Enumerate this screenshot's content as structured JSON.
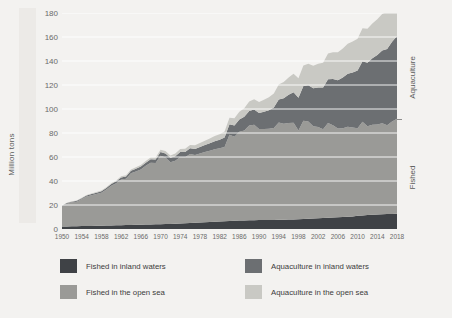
{
  "chart_data": {
    "type": "area",
    "stacked": true,
    "title": "",
    "xlabel": "",
    "ylabel": "Million tons",
    "ylim": [
      0,
      180
    ],
    "xlim": [
      1950,
      2018
    ],
    "grid": true,
    "legend_position": "bottom",
    "ytick_labels": [
      "180",
      "160",
      "140",
      "120",
      "100",
      "80",
      "60",
      "40",
      "20",
      "0"
    ],
    "ytick_values": [
      180,
      160,
      140,
      120,
      100,
      80,
      60,
      40,
      20,
      0
    ],
    "xtick_labels": [
      "1950",
      "1954",
      "1958",
      "1962",
      "1966",
      "1970",
      "1974",
      "1978",
      "1982",
      "1986",
      "1990",
      "1994",
      "1998",
      "2002",
      "2006",
      "2010",
      "2014",
      "2018"
    ],
    "xtick_values": [
      1950,
      1954,
      1958,
      1962,
      1966,
      1970,
      1974,
      1978,
      1982,
      1986,
      1990,
      1994,
      1998,
      2002,
      2006,
      2010,
      2014,
      2018
    ],
    "side_labels": [
      {
        "name": "group-label-aquaculture",
        "text": "Aquaculture"
      },
      {
        "name": "group-label-fished",
        "text": "Fished"
      }
    ],
    "colors": {
      "fished_inland": "#3f4246",
      "fished_open_sea": "#9a9a97",
      "aquaculture_inland": "#6c6f72",
      "aquaculture_open_sea": "#c9c9c4",
      "background": "#f3f2f0",
      "gridline": "#ffffff",
      "axis_text": "#6a6a6a"
    },
    "x": [
      1950,
      1951,
      1952,
      1953,
      1954,
      1955,
      1956,
      1957,
      1958,
      1959,
      1960,
      1961,
      1962,
      1963,
      1964,
      1965,
      1966,
      1967,
      1968,
      1969,
      1970,
      1971,
      1972,
      1973,
      1974,
      1975,
      1976,
      1977,
      1978,
      1979,
      1980,
      1981,
      1982,
      1983,
      1984,
      1985,
      1986,
      1987,
      1988,
      1989,
      1990,
      1991,
      1992,
      1993,
      1994,
      1995,
      1996,
      1997,
      1998,
      1999,
      2000,
      2001,
      2002,
      2003,
      2004,
      2005,
      2006,
      2007,
      2008,
      2009,
      2010,
      2011,
      2012,
      2013,
      2014,
      2015,
      2016,
      2017,
      2018
    ],
    "series": [
      {
        "name": "Fished in inland waters",
        "key": "fished_inland",
        "color": "#3f4246",
        "values": [
          2.0,
          2.1,
          2.2,
          2.3,
          2.4,
          2.5,
          2.6,
          2.7,
          2.8,
          2.9,
          3.0,
          3.1,
          3.2,
          3.3,
          3.4,
          3.5,
          3.6,
          3.7,
          3.8,
          3.9,
          4.0,
          4.1,
          4.2,
          4.4,
          4.6,
          4.8,
          5.0,
          5.2,
          5.4,
          5.6,
          5.8,
          6.0,
          6.2,
          6.4,
          6.6,
          6.8,
          7.0,
          7.1,
          7.2,
          7.3,
          7.4,
          7.4,
          7.5,
          7.6,
          7.7,
          7.8,
          7.9,
          8.0,
          8.1,
          8.3,
          8.5,
          8.7,
          8.9,
          9.1,
          9.3,
          9.5,
          9.7,
          10.0,
          10.3,
          10.5,
          11.0,
          11.3,
          11.6,
          11.8,
          12.0,
          12.2,
          12.4,
          12.6,
          12.8
        ]
      },
      {
        "name": "Fished in the open sea",
        "key": "fished_open_sea",
        "color": "#9a9a97",
        "values": [
          17.0,
          19.0,
          20.0,
          20.5,
          22.5,
          24.5,
          25.5,
          26.5,
          27.5,
          30.0,
          33.0,
          35.0,
          38.0,
          38.5,
          43.0,
          44.5,
          46.0,
          49.0,
          51.5,
          51.0,
          57.0,
          55.5,
          51.5,
          52.5,
          55.5,
          55.0,
          57.5,
          56.5,
          57.5,
          58.5,
          59.5,
          60.5,
          61.0,
          62.0,
          72.0,
          70.0,
          74.0,
          75.0,
          79.0,
          79.5,
          76.0,
          76.0,
          76.0,
          76.5,
          81.0,
          80.0,
          80.5,
          80.5,
          74.0,
          82.0,
          81.0,
          77.0,
          76.0,
          74.0,
          79.0,
          77.0,
          74.0,
          74.0,
          75.0,
          74.0,
          73.0,
          78.0,
          74.0,
          75.0,
          75.0,
          76.0,
          74.0,
          77.0,
          79.0
        ]
      },
      {
        "name": "Aquaculture in inland waters",
        "key": "aquaculture_inland",
        "color": "#6c6f72",
        "values": [
          0.4,
          0.5,
          0.6,
          0.7,
          0.8,
          0.9,
          1.0,
          1.1,
          1.2,
          1.3,
          1.5,
          1.6,
          1.8,
          1.9,
          2.1,
          2.2,
          2.4,
          2.6,
          2.8,
          3.0,
          3.2,
          3.4,
          3.6,
          3.8,
          4.1,
          4.4,
          4.7,
          5.0,
          5.4,
          5.8,
          6.2,
          6.7,
          7.2,
          7.8,
          8.6,
          9.4,
          10.3,
          11.4,
          12.2,
          12.8,
          13.2,
          14.3,
          15.5,
          17.2,
          19.2,
          21.1,
          23.4,
          25.4,
          27.3,
          28.8,
          30.2,
          31.5,
          33.0,
          34.8,
          36.5,
          38.4,
          40.3,
          42.3,
          44.0,
          46.0,
          48.0,
          50.5,
          53.0,
          55.5,
          58.0,
          60.5,
          63.5,
          66.5,
          69.0
        ]
      },
      {
        "name": "Aquaculture in the open sea",
        "key": "aquaculture_open_sea",
        "color": "#c9c9c4",
        "values": [
          0.2,
          0.2,
          0.3,
          0.3,
          0.4,
          0.4,
          0.5,
          0.5,
          0.6,
          0.6,
          0.7,
          0.8,
          0.9,
          1.0,
          1.1,
          1.2,
          1.3,
          1.4,
          1.5,
          1.6,
          1.8,
          1.9,
          2.0,
          2.2,
          2.4,
          2.6,
          2.8,
          3.0,
          3.3,
          3.6,
          3.9,
          4.2,
          4.6,
          5.0,
          5.5,
          6.0,
          6.5,
          7.1,
          7.8,
          8.5,
          9.2,
          10.0,
          10.8,
          11.7,
          12.6,
          13.5,
          14.5,
          15.4,
          16.3,
          17.2,
          18.0,
          18.9,
          19.8,
          20.7,
          21.5,
          22.4,
          23.3,
          24.1,
          25.0,
          25.8,
          26.6,
          27.4,
          28.2,
          29.0,
          29.8,
          30.5,
          31.2,
          31.9,
          32.4
        ]
      }
    ]
  },
  "legend": {
    "items": [
      {
        "name": "legend-fished-inland",
        "label": "Fished in inland waters",
        "color": "#3f4246"
      },
      {
        "name": "legend-fished-open-sea",
        "label": "Fished in the open sea",
        "color": "#9a9a97"
      },
      {
        "name": "legend-aquaculture-inland",
        "label": "Aquaculture in inland waters",
        "color": "#6c6f72"
      },
      {
        "name": "legend-aquaculture-open-sea",
        "label": "Aquaculture in the open sea",
        "color": "#c9c9c4"
      }
    ]
  }
}
